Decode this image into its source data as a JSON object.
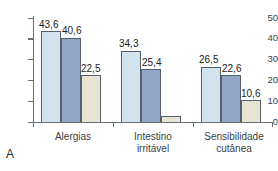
{
  "panel": {
    "letter": "A"
  },
  "chart_data": {
    "type": "bar",
    "title": "",
    "subtitle": "",
    "xlabel": "",
    "ylabel": "",
    "ylim": [
      0,
      50
    ],
    "yticks": [
      0,
      10,
      20,
      30,
      40,
      50
    ],
    "ytick_labels": [
      "0",
      "10",
      "20",
      "30",
      "40",
      "50"
    ],
    "grid": false,
    "legend": "none",
    "decimal_separator": ",",
    "categories": [
      "Alergias",
      "Intestino\nirritável",
      "Sensibilidade\ncutânea"
    ],
    "series": [
      {
        "name": "series-1",
        "color": "#d3e3ee",
        "values": [
          43.6,
          34.3,
          26.5
        ]
      },
      {
        "name": "series-2",
        "color": "#8fa6c4",
        "values": [
          40.6,
          25.4,
          22.6
        ]
      },
      {
        "name": "series-3",
        "color": "#e7e4d3",
        "values": [
          22.5,
          3.0,
          10.6
        ]
      }
    ],
    "data_labels": [
      [
        "43,6",
        "34,3",
        "26,5"
      ],
      [
        "40,6",
        "25,4",
        "22,6"
      ],
      [
        "22,5",
        "",
        "10,6"
      ]
    ]
  }
}
